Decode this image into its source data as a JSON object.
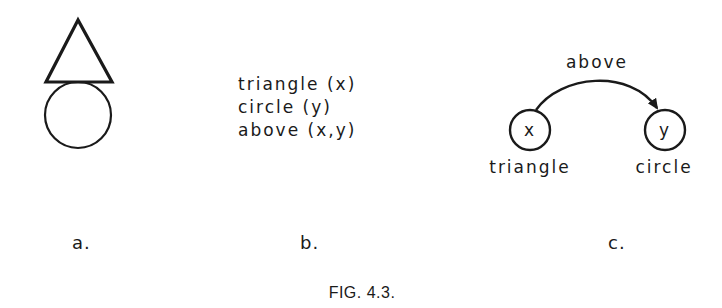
{
  "figure": {
    "caption": "FIG. 4.3.",
    "panels": {
      "a": {
        "label": "a.",
        "shapes": [
          {
            "type": "triangle",
            "position": "top"
          },
          {
            "type": "circle",
            "position": "bottom"
          }
        ]
      },
      "b": {
        "label": "b.",
        "predicates": [
          "triangle (x)",
          "circle (y)",
          "above (x,y)"
        ]
      },
      "c": {
        "label": "c.",
        "nodes": [
          {
            "id": "x",
            "symbol": "x",
            "caption": "triangle"
          },
          {
            "id": "y",
            "symbol": "y",
            "caption": "circle"
          }
        ],
        "edges": [
          {
            "from": "x",
            "to": "y",
            "label": "above"
          }
        ]
      }
    },
    "colors": {
      "ink": "#1a1a1a",
      "background": "#ffffff"
    }
  }
}
